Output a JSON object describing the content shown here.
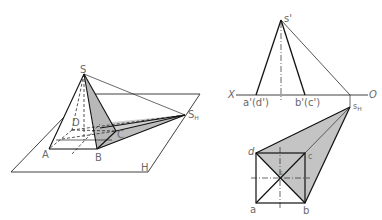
{
  "figure": {
    "colors": {
      "line": "#1a1a1a",
      "thin_line": "#3a3a3a",
      "shadow_fill": "#c4c4c4",
      "label": "#6a6a6a"
    }
  },
  "left_view": {
    "labels": {
      "S": "S",
      "S_H_main": "S",
      "S_H_sub": "H",
      "A": "A",
      "B": "B",
      "C": "C",
      "D": "D",
      "H": "H"
    }
  },
  "right_view": {
    "labels": {
      "s_prime": "s'",
      "X": "X",
      "O": "O",
      "a_prime_d_prime": "a'(d')",
      "b_prime_c_prime": "b'(c')",
      "s_H_main": "s",
      "s_H_sub": "H",
      "a": "a",
      "b": "b",
      "c": "c",
      "d": "d",
      "s": "s"
    }
  }
}
